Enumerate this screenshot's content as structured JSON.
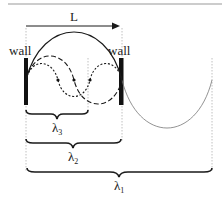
{
  "diagram": {
    "length_label": "L",
    "walls": [
      {
        "label": "wall",
        "side": "left"
      },
      {
        "label": "wall",
        "side": "right"
      }
    ],
    "wavelengths": [
      {
        "symbol": "λ",
        "subscript": "3",
        "span": "2/3 L",
        "style": "short-dashed"
      },
      {
        "symbol": "λ",
        "subscript": "2",
        "span": "L",
        "style": "long-dashed"
      },
      {
        "symbol": "λ",
        "subscript": "1",
        "span": "2 L",
        "style": "solid"
      }
    ],
    "colors": {
      "line": "#1a1a1a",
      "thin_curve": "#777777",
      "guide": "#b0b0b0",
      "border": "#999999"
    }
  }
}
